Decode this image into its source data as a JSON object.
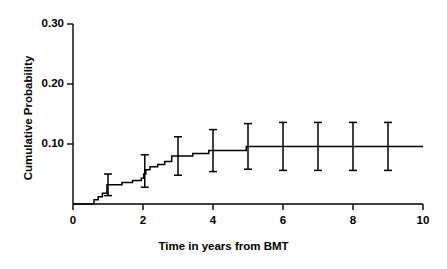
{
  "chart_data": {
    "type": "line",
    "subtype": "kaplan-meier-cumulative-incidence-step",
    "title": "",
    "xlabel": "Time in years from BMT",
    "ylabel": "Cumulative Probability",
    "xlim": [
      0,
      10
    ],
    "ylim": [
      0,
      0.3
    ],
    "xticks": [
      0,
      2,
      4,
      6,
      8,
      10
    ],
    "xtick_labels": [
      "0",
      "2",
      "4",
      "6",
      "8",
      "10"
    ],
    "yticks": [
      0.1,
      0.2,
      0.3
    ],
    "ytick_labels": [
      "0.10",
      "0.20",
      "0.30"
    ],
    "grid": false,
    "legend": false,
    "line_color": "#000000",
    "series": [
      {
        "name": "Cumulative probability",
        "step_points": [
          {
            "x": 0.0,
            "y": 0.0
          },
          {
            "x": 0.55,
            "y": 0.0
          },
          {
            "x": 0.6,
            "y": 0.007
          },
          {
            "x": 0.72,
            "y": 0.012
          },
          {
            "x": 0.84,
            "y": 0.018
          },
          {
            "x": 0.97,
            "y": 0.032
          },
          {
            "x": 1.4,
            "y": 0.036
          },
          {
            "x": 1.7,
            "y": 0.039
          },
          {
            "x": 1.95,
            "y": 0.043
          },
          {
            "x": 2.02,
            "y": 0.05
          },
          {
            "x": 2.08,
            "y": 0.057
          },
          {
            "x": 2.2,
            "y": 0.062
          },
          {
            "x": 2.42,
            "y": 0.066
          },
          {
            "x": 2.62,
            "y": 0.071
          },
          {
            "x": 2.82,
            "y": 0.08
          },
          {
            "x": 3.3,
            "y": 0.08
          },
          {
            "x": 3.42,
            "y": 0.084
          },
          {
            "x": 3.88,
            "y": 0.089
          },
          {
            "x": 4.05,
            "y": 0.089
          },
          {
            "x": 4.95,
            "y": 0.096
          },
          {
            "x": 10.0,
            "y": 0.096
          }
        ]
      }
    ],
    "error_bars": [
      {
        "x": 1.0,
        "y": 0.032,
        "lower": 0.014,
        "upper": 0.05
      },
      {
        "x": 2.05,
        "y": 0.055,
        "lower": 0.028,
        "upper": 0.082
      },
      {
        "x": 3.0,
        "y": 0.08,
        "lower": 0.048,
        "upper": 0.112
      },
      {
        "x": 4.0,
        "y": 0.089,
        "lower": 0.054,
        "upper": 0.124
      },
      {
        "x": 5.0,
        "y": 0.096,
        "lower": 0.058,
        "upper": 0.134
      },
      {
        "x": 6.0,
        "y": 0.096,
        "lower": 0.056,
        "upper": 0.136
      },
      {
        "x": 7.0,
        "y": 0.096,
        "lower": 0.056,
        "upper": 0.136
      },
      {
        "x": 8.0,
        "y": 0.096,
        "lower": 0.056,
        "upper": 0.136
      },
      {
        "x": 9.0,
        "y": 0.096,
        "lower": 0.056,
        "upper": 0.136
      }
    ]
  },
  "axes": {
    "x_title": "Time in years from BMT",
    "y_title": "Cumulative Probability",
    "x_tick_labels": [
      "0",
      "2",
      "4",
      "6",
      "8",
      "10"
    ],
    "y_tick_labels": [
      "0.10",
      "0.20",
      "0.30"
    ]
  }
}
